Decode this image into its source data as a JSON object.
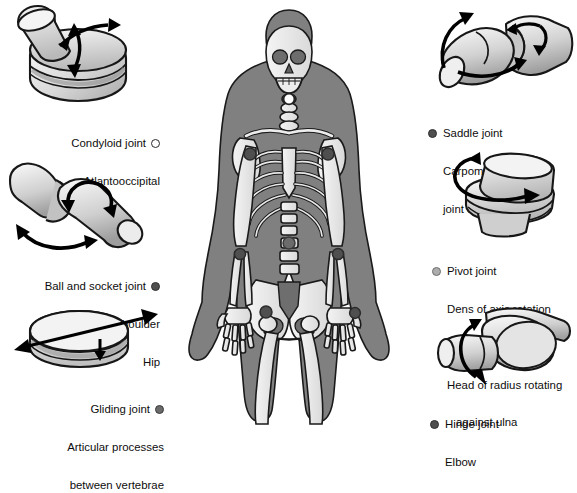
{
  "figure": {
    "background": "#ffffff",
    "body_silhouette_color": "#808080",
    "bone_color": "#e8e8e8",
    "bone_outline": "#1a1a1a",
    "arrow_color": "#000000"
  },
  "markers": {
    "condyloid": {
      "style": "open",
      "fill": "#ffffff",
      "stroke": "#2b2b2b"
    },
    "ball_socket": {
      "style": "dark",
      "fill": "#4f4f4f",
      "stroke": "#303030"
    },
    "gliding": {
      "style": "dark",
      "fill": "#6b6b6b",
      "stroke": "#3a3a3a"
    },
    "saddle": {
      "style": "dark",
      "fill": "#4f4f4f",
      "stroke": "#303030"
    },
    "pivot": {
      "style": "light",
      "fill": "#adadad",
      "stroke": "#6e6e6e"
    },
    "hinge": {
      "style": "dark",
      "fill": "#4f4f4f",
      "stroke": "#303030"
    }
  },
  "joints": {
    "condyloid": {
      "name": "Condyloid joint",
      "icon": "condyloid-joint-illustration",
      "examples": [
        "Atlantooccipital"
      ],
      "motion": "biaxial",
      "arrows": 2
    },
    "ball_and_socket": {
      "name": "Ball and socket joint",
      "icon": "ball-and-socket-joint-illustration",
      "examples": [
        "Shoulder",
        "Hip"
      ],
      "motion": "multiaxial",
      "arrows": 2
    },
    "gliding": {
      "name": "Gliding joint",
      "icon": "gliding-joint-illustration",
      "examples": [
        "Articular processes",
        "between vertebrae"
      ],
      "motion": "gliding",
      "arrows": 2
    },
    "saddle": {
      "name": "Saddle joint",
      "icon": "saddle-joint-illustration",
      "examples": [
        "Carpometacarpal",
        "joint of thumb"
      ],
      "motion": "biaxial",
      "arrows": 2
    },
    "pivot": {
      "name": "Pivot joint",
      "icon": "pivot-joint-illustration",
      "examples": [
        "Dens of axis rotation",
        "against atlas",
        "Head of radius rotating",
        "against ulna"
      ],
      "motion": "uniaxial rotation",
      "arrows": 1
    },
    "hinge": {
      "name": "Hinge joint",
      "icon": "hinge-joint-illustration",
      "examples": [
        "Elbow"
      ],
      "motion": "uniaxial",
      "arrows": 1
    }
  },
  "skeleton": {
    "name": "human-skeleton-anterior-view",
    "joint_sites": [
      {
        "site": "atlantooccipital",
        "marker": "condyloid"
      },
      {
        "site": "shoulder-left",
        "marker": "ball_socket"
      },
      {
        "site": "shoulder-right",
        "marker": "ball_socket"
      },
      {
        "site": "vertebral-articular-process",
        "marker": "gliding"
      },
      {
        "site": "elbow-left",
        "marker": "hinge"
      },
      {
        "site": "elbow-right",
        "marker": "hinge"
      },
      {
        "site": "carpometacarpal-thumb",
        "marker": "saddle"
      },
      {
        "site": "hip",
        "marker": "ball_socket"
      }
    ]
  }
}
